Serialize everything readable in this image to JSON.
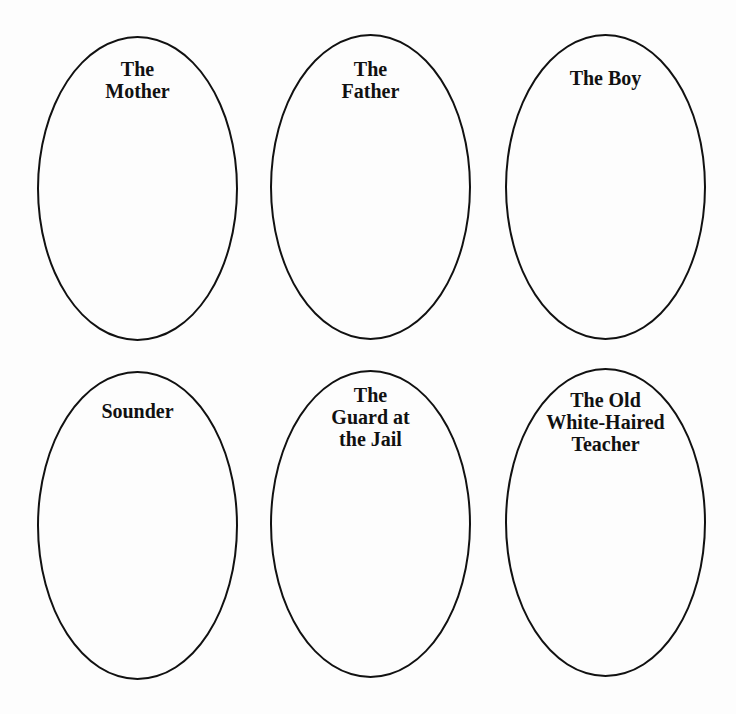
{
  "ovals": [
    {
      "label": "The\nMother"
    },
    {
      "label": "The\nFather"
    },
    {
      "label": "The Boy"
    },
    {
      "label": "Sounder"
    },
    {
      "label": "The\nGuard at\nthe Jail"
    },
    {
      "label": "The Old\nWhite-Haired\nTeacher"
    }
  ]
}
